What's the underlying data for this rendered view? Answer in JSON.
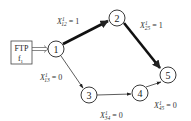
{
  "diagram": {
    "source_box": {
      "line1": "FTP",
      "line2": "f",
      "line2_sub": "1"
    },
    "nodes": [
      {
        "id": "1",
        "label": "1",
        "cx": 56,
        "cy": 49
      },
      {
        "id": "2",
        "label": "2",
        "cx": 117,
        "cy": 18
      },
      {
        "id": "3",
        "label": "3",
        "cx": 89,
        "cy": 95
      },
      {
        "id": "4",
        "label": "4",
        "cx": 140,
        "cy": 93
      },
      {
        "id": "5",
        "label": "5",
        "cx": 168,
        "cy": 75
      }
    ],
    "edges": [
      {
        "from": "1",
        "to": "2",
        "var": "X",
        "sup": "1",
        "sub": "12",
        "value": "= 1",
        "bold": true
      },
      {
        "from": "2",
        "to": "5",
        "var": "X",
        "sup": "1",
        "sub": "25",
        "value": "= 1",
        "bold": true
      },
      {
        "from": "1",
        "to": "3",
        "var": "X",
        "sup": "1",
        "sub": "13",
        "value": "= 0",
        "bold": false
      },
      {
        "from": "3",
        "to": "4",
        "var": "X",
        "sup": "1",
        "sub": "34",
        "value": "= 0",
        "bold": false
      },
      {
        "from": "4",
        "to": "5",
        "var": "X",
        "sup": "1",
        "sub": "45",
        "value": "= 0",
        "bold": false
      }
    ],
    "colors": {
      "stroke": "#222222",
      "text": "#333333"
    }
  }
}
